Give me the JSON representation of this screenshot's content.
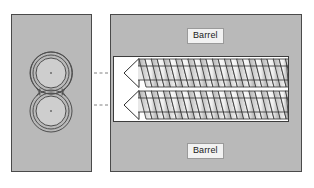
{
  "figure": {
    "colors": {
      "panel_gray": "#b9b9b9",
      "panel_border": "#4a4a4a",
      "channel_white": "#ffffff",
      "outline": "#3c3c3c",
      "label_background": "#f2f2f2",
      "label_border": "#9a9a9a",
      "label_text": "#1a1a1a",
      "dashed_link": "#808080",
      "bore_inner": "#cecece"
    }
  },
  "left_panel": {
    "name": "cross-section-view",
    "bounds": {
      "x": 11,
      "y": 14,
      "width": 81,
      "height": 158
    },
    "bore": {
      "shape": "figure-eight",
      "count": 2,
      "rings_per_bore": 3,
      "upper_center": {
        "x": 51,
        "y": 73
      },
      "lower_center": {
        "x": 51,
        "y": 111
      },
      "outer_radius": 21,
      "middle_radius": 18,
      "inner_radius": 15,
      "center_dot_radius": 1
    }
  },
  "right_panel": {
    "name": "longitudinal-view",
    "bounds": {
      "x": 110,
      "y": 14,
      "width": 192,
      "height": 158
    },
    "channel": {
      "x": 113,
      "y": 56,
      "width": 176,
      "height": 66
    },
    "labels": {
      "barrel_top": "Barrel",
      "barrel_bottom": "Barrel"
    },
    "screws": [
      {
        "id": "upper-screw",
        "axis_y": 73,
        "tip_x": 124,
        "root_x": 286,
        "flight_count": 13,
        "flight_pitch": 12.2
      },
      {
        "id": "lower-screw",
        "axis_y": 105,
        "tip_x": 124,
        "root_x": 286,
        "flight_count": 13,
        "flight_pitch": 12.2
      }
    ]
  },
  "connectors": [
    {
      "id": "upper-link",
      "from_x": 94,
      "to_x": 113,
      "y": 73
    },
    {
      "id": "lower-link",
      "from_x": 94,
      "to_x": 113,
      "y": 105
    }
  ]
}
